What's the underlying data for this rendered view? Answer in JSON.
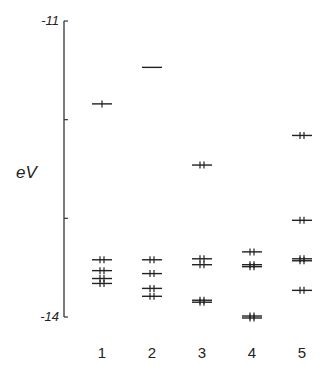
{
  "figure": {
    "y_axis_label": "eV",
    "y_ticks": [
      {
        "value": -11,
        "label": "-11"
      },
      {
        "value": -12,
        "label": ""
      },
      {
        "value": -13,
        "label": ""
      },
      {
        "value": -14,
        "label": "-14"
      }
    ],
    "columns": [
      "1",
      "2",
      "3",
      "4",
      "5"
    ]
  },
  "chart_data": {
    "type": "energy-level-diagram",
    "title": "",
    "xlabel": "",
    "ylabel": "eV",
    "ylim": [
      -14,
      -11
    ],
    "y_tick_labels": [
      "-11",
      "-14"
    ],
    "categories": [
      "1",
      "2",
      "3",
      "4",
      "5"
    ],
    "levels": [
      {
        "column": "1",
        "energies": [
          {
            "e": -11.84,
            "electrons": 1
          },
          {
            "e": -13.42,
            "electrons": 2
          },
          {
            "e": -13.53,
            "electrons": 2
          },
          {
            "e": -13.61,
            "electrons": 2
          },
          {
            "e": -13.66,
            "electrons": 2
          }
        ]
      },
      {
        "column": "2",
        "energies": [
          {
            "e": -11.47,
            "electrons": 0
          },
          {
            "e": -13.42,
            "electrons": 2
          },
          {
            "e": -13.56,
            "electrons": 2
          },
          {
            "e": -13.71,
            "electrons": 2
          },
          {
            "e": -13.79,
            "electrons": 2
          }
        ]
      },
      {
        "column": "3",
        "energies": [
          {
            "e": -12.46,
            "electrons": 2
          },
          {
            "e": -13.41,
            "electrons": 2
          },
          {
            "e": -13.47,
            "electrons": 2
          },
          {
            "e": -13.83,
            "electrons": 2
          },
          {
            "e": -13.85,
            "electrons": 2
          }
        ]
      },
      {
        "column": "4",
        "energies": [
          {
            "e": -13.34,
            "electrons": 2
          },
          {
            "e": -13.47,
            "electrons": 2
          },
          {
            "e": -13.49,
            "electrons": 2
          },
          {
            "e": -13.99,
            "electrons": 2
          },
          {
            "e": -14.01,
            "electrons": 2
          }
        ]
      },
      {
        "column": "5",
        "energies": [
          {
            "e": -12.16,
            "electrons": 2
          },
          {
            "e": -13.02,
            "electrons": 2
          },
          {
            "e": -13.41,
            "electrons": 2
          },
          {
            "e": -13.43,
            "electrons": 2
          },
          {
            "e": -13.73,
            "electrons": 2
          }
        ]
      }
    ]
  }
}
